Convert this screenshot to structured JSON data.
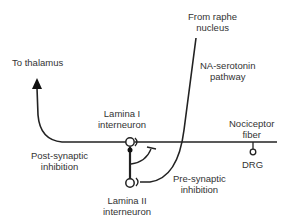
{
  "labels": {
    "to_thalamus": "To thalamus",
    "from_raphe": [
      "From raphe",
      "nucleus"
    ],
    "na_serotonin": [
      "NA-serotonin",
      "pathway"
    ],
    "lamina_i": [
      "Lamina I",
      "interneuron"
    ],
    "nociceptor": [
      "Nociceptor",
      "fiber"
    ],
    "post_synaptic": [
      "Post-synaptic",
      "inhibition"
    ],
    "drg": "DRG",
    "pre_synaptic": [
      "Pre-synaptic",
      "inhibition"
    ],
    "lamina_ii": [
      "Lamina II",
      "interneuron"
    ]
  },
  "colors": {
    "line": "#222222",
    "text": "#333333",
    "background": "#ffffff"
  }
}
